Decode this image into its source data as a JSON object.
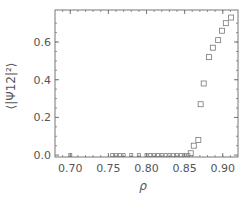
{
  "chart_data": {
    "type": "scatter",
    "title": "",
    "xlabel": "ρ",
    "ylabel": "⟨|Ψ12|²⟩",
    "xlim": [
      0.68,
      0.92
    ],
    "ylim": [
      -0.01,
      0.77
    ],
    "xticks": [
      0.7,
      0.75,
      0.8,
      0.85,
      0.9
    ],
    "xtick_labels": [
      "0.70",
      "0.75",
      "0.80",
      "0.85",
      "0.90"
    ],
    "yticks": [
      0.0,
      0.2,
      0.4,
      0.6
    ],
    "ytick_labels": [
      "0.0",
      "0.2",
      "0.4",
      "0.6"
    ],
    "grid": false,
    "legend": null,
    "marker": "open-square",
    "marker_color": "#777777",
    "series": [
      {
        "name": "⟨|Ψ12|²⟩",
        "x": [
          0.7,
          0.755,
          0.76,
          0.765,
          0.77,
          0.78,
          0.79,
          0.8,
          0.805,
          0.81,
          0.815,
          0.82,
          0.825,
          0.83,
          0.835,
          0.84,
          0.845,
          0.85,
          0.855,
          0.858,
          0.862,
          0.868,
          0.871,
          0.875,
          0.882,
          0.887,
          0.894,
          0.899,
          0.904,
          0.911
        ],
        "y": [
          0.0,
          0.0,
          0.0,
          0.0,
          0.0,
          0.0,
          0.0,
          0.0,
          0.0,
          0.0,
          0.0,
          0.0,
          0.0,
          0.0,
          0.0,
          0.0,
          0.0,
          0.0,
          0.0,
          0.01,
          0.05,
          0.08,
          0.27,
          0.38,
          0.52,
          0.57,
          0.61,
          0.66,
          0.7,
          0.73
        ]
      }
    ]
  }
}
